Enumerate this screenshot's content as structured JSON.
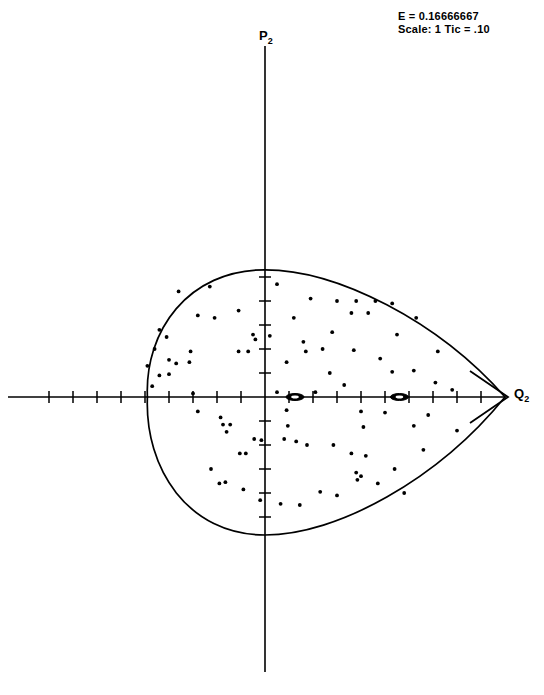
{
  "annotations": {
    "energy_line": "E = 0.16666667",
    "scale_line": "Scale: 1 Tic = .10"
  },
  "axes": {
    "y_label_text": "P",
    "y_label_sub": "2",
    "x_label_text": "Q",
    "x_label_sub": "2"
  },
  "chart_data": {
    "type": "scatter",
    "title": "",
    "subtitle": "",
    "xlabel": "Q2",
    "ylabel": "P2",
    "energy": 0.16666667,
    "tick_interval": 0.1,
    "scale_note": "1 Tic = .10",
    "grid": false,
    "legend": "none",
    "axis_style": "crossed-axes-at-origin",
    "x_arrowhead": true,
    "xlim": [
      -1.0,
      1.04
    ],
    "ylim": [
      -0.58,
      0.58
    ],
    "origin_px": [
      265,
      397
    ],
    "px_per_unit": 240,
    "x_ticks": [
      -0.9,
      -0.8,
      -0.7,
      -0.6,
      -0.5,
      -0.4,
      -0.3,
      -0.2,
      -0.1,
      0.1,
      0.2,
      0.3,
      0.4,
      0.5,
      0.6,
      0.7,
      0.8,
      0.9
    ],
    "y_ticks": [
      -0.5,
      -0.4,
      -0.3,
      -0.2,
      -0.1,
      0.1,
      0.2,
      0.3,
      0.4,
      0.5
    ],
    "separatrix": {
      "name": "energy-boundary-teardrop",
      "description": "Closed teardrop-shaped zero-velocity curve, symmetric about Q2 axis, cusp at right",
      "left_crossing": -0.49,
      "cusp": 1.0,
      "max_p": 0.53,
      "min_p": -0.575,
      "apex_q": 0.0
    },
    "fixed_points": [
      {
        "name": "island-center-1",
        "x": 0.125,
        "y": 0.0,
        "rx": 9,
        "ry": 3.5
      },
      {
        "name": "island-center-2",
        "x": 0.56,
        "y": 0.0,
        "rx": 9,
        "ry": 3.5
      }
    ],
    "points": [
      [
        -0.36,
        0.44
      ],
      [
        -0.23,
        0.46
      ],
      [
        0.05,
        0.47
      ],
      [
        0.3,
        0.4
      ],
      [
        0.38,
        0.4
      ],
      [
        0.46,
        0.4
      ],
      [
        0.53,
        0.39
      ],
      [
        0.19,
        0.41
      ],
      [
        -0.28,
        0.34
      ],
      [
        -0.21,
        0.33
      ],
      [
        -0.11,
        0.36
      ],
      [
        0.36,
        0.35
      ],
      [
        0.43,
        0.35
      ],
      [
        -0.44,
        0.28
      ],
      [
        -0.41,
        0.25
      ],
      [
        0.63,
        0.33
      ],
      [
        -0.05,
        0.26
      ],
      [
        -0.04,
        0.24
      ],
      [
        0.02,
        0.255
      ],
      [
        0.28,
        0.27
      ],
      [
        0.16,
        0.23
      ],
      [
        -0.31,
        0.19
      ],
      [
        -0.11,
        0.19
      ],
      [
        -0.07,
        0.19
      ],
      [
        0.17,
        0.19
      ],
      [
        0.24,
        0.2
      ],
      [
        0.37,
        0.195
      ],
      [
        -0.4,
        0.155
      ],
      [
        -0.37,
        0.14
      ],
      [
        -0.315,
        0.145
      ],
      [
        0.09,
        0.145
      ],
      [
        0.48,
        0.16
      ],
      [
        -0.44,
        0.09
      ],
      [
        -0.4,
        0.095
      ],
      [
        0.27,
        0.1
      ],
      [
        0.53,
        0.105
      ],
      [
        0.62,
        0.11
      ],
      [
        -0.47,
        0.045
      ],
      [
        0.33,
        0.05
      ],
      [
        0.71,
        0.06
      ],
      [
        0.78,
        0.03
      ],
      [
        -0.3,
        0.015
      ],
      [
        0.05,
        0.02
      ],
      [
        0.21,
        0.02
      ],
      [
        -0.28,
        -0.06
      ],
      [
        0.09,
        -0.055
      ],
      [
        0.4,
        -0.06
      ],
      [
        0.5,
        -0.065
      ],
      [
        0.68,
        -0.075
      ],
      [
        -0.185,
        -0.085
      ],
      [
        -0.175,
        -0.115
      ],
      [
        -0.145,
        -0.115
      ],
      [
        -0.16,
        -0.145
      ],
      [
        0.095,
        -0.12
      ],
      [
        0.41,
        -0.125
      ],
      [
        0.62,
        -0.12
      ],
      [
        -0.045,
        -0.175
      ],
      [
        -0.015,
        -0.18
      ],
      [
        0.08,
        -0.175
      ],
      [
        0.13,
        -0.185
      ],
      [
        0.175,
        -0.2
      ],
      [
        0.285,
        -0.2
      ],
      [
        -0.105,
        -0.235
      ],
      [
        -0.08,
        -0.235
      ],
      [
        0.36,
        -0.235
      ],
      [
        0.42,
        -0.245
      ],
      [
        -0.225,
        -0.3
      ],
      [
        0.54,
        -0.3
      ],
      [
        0.38,
        -0.315
      ],
      [
        0.385,
        -0.345
      ],
      [
        0.4,
        -0.33
      ],
      [
        -0.19,
        -0.36
      ],
      [
        -0.165,
        -0.355
      ],
      [
        0.47,
        -0.36
      ],
      [
        -0.09,
        -0.385
      ],
      [
        0.23,
        -0.395
      ],
      [
        0.3,
        -0.41
      ],
      [
        0.58,
        -0.4
      ],
      [
        -0.02,
        -0.43
      ],
      [
        0.065,
        -0.445
      ],
      [
        0.145,
        -0.45
      ],
      [
        -0.46,
        0.2
      ],
      [
        0.72,
        0.19
      ],
      [
        0.8,
        -0.14
      ],
      [
        0.66,
        -0.22
      ],
      [
        0.55,
        0.26
      ],
      [
        0.12,
        0.33
      ],
      [
        -0.49,
        0.13
      ]
    ]
  }
}
